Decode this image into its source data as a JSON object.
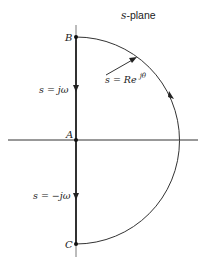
{
  "title": "s-plane",
  "points": {
    "B": "B",
    "A": "A",
    "C": "C"
  },
  "labels": {
    "upper_axis": "s = jω",
    "lower_axis": "s = −jω",
    "arc_prefix": "s = Re",
    "arc_exponent": "jθ"
  },
  "colors": {
    "stroke": "#222222",
    "background": "#ffffff"
  }
}
